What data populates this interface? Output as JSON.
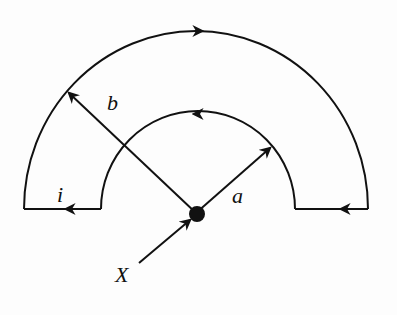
{
  "diagram": {
    "labels": {
      "inner_radius": "a",
      "outer_radius": "b",
      "current": "i",
      "point": "X"
    },
    "colors": {
      "stroke": "#111111",
      "background": "#fdfdfd"
    },
    "geometry": {
      "center": [
        196,
        213
      ],
      "outer_arc_radius_x": 172,
      "outer_arc_radius_y": 182,
      "inner_arc_radius_x": 95,
      "inner_arc_radius_y": 100,
      "baseline_y": 209
    },
    "arrows": {
      "outer_arc": "clockwise (left to right over the top)",
      "inner_arc": "counter-clockwise (right to left over the top)",
      "left_segment": "pointing left",
      "right_segment": "pointing left"
    }
  }
}
